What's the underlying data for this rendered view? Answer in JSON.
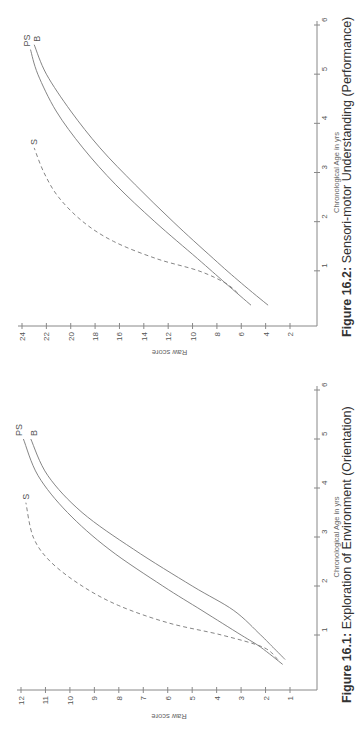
{
  "figures": [
    {
      "id": "fig-16-2",
      "caption_number": "Figure 16.2:",
      "caption_text": "Sensori-motor Understanding (Performance)",
      "xlabel": "Chronological Age in yrs",
      "ylabel": "Raw score"
    },
    {
      "id": "fig-16-1",
      "caption_number": "Figure 16.1:",
      "caption_text": "Exploration of Environment (Orientation)",
      "xlabel": "Chronological Age in yrs",
      "ylabel": "Raw score"
    }
  ],
  "chart_data": [
    {
      "type": "line",
      "title": "Figure 16.2: Sensori-motor Understanding (Performance)",
      "xlabel": "Chronological Age in yrs",
      "ylabel": "Raw score",
      "xlim": [
        0,
        6
      ],
      "ylim": [
        0,
        24
      ],
      "xticks": [
        1,
        2,
        3,
        4,
        5,
        6
      ],
      "yticks": [
        2,
        4,
        6,
        8,
        10,
        12,
        14,
        16,
        18,
        20,
        22,
        24
      ],
      "orientation": "rotated 90 degrees counter-clockwise on page",
      "grid": false,
      "series": [
        {
          "name": "PS",
          "style": "solid",
          "x": [
            0.3,
            0.75,
            1.25,
            2.0,
            2.75,
            3.5,
            4.25,
            5.0,
            5.5
          ],
          "y": [
            5.2,
            7.3,
            9.6,
            13.1,
            16.3,
            19.0,
            21.2,
            22.7,
            23.3
          ]
        },
        {
          "name": "B",
          "style": "solid",
          "x": [
            0.3,
            0.75,
            1.25,
            2.0,
            2.75,
            3.5,
            4.25,
            5.0,
            5.6
          ],
          "y": [
            3.8,
            6.0,
            8.3,
            11.6,
            14.7,
            17.6,
            20.0,
            22.0,
            23.0
          ]
        },
        {
          "name": "S",
          "style": "dashed",
          "x": [
            0.55,
            0.75,
            1.0,
            1.25,
            1.6,
            2.0,
            2.5,
            3.0,
            3.5
          ],
          "y": [
            6.3,
            7.3,
            9.5,
            13.0,
            16.5,
            19.0,
            21.0,
            22.2,
            23.0
          ]
        }
      ]
    },
    {
      "type": "line",
      "title": "Figure 16.1: Exploration of Environment (Orientation)",
      "xlabel": "Chronological Age in yrs",
      "ylabel": "Raw score",
      "xlim": [
        0,
        6
      ],
      "ylim": [
        0.7,
        12
      ],
      "xticks": [
        1,
        2,
        3,
        4,
        5,
        6
      ],
      "yticks": [
        1,
        2,
        3,
        4,
        5,
        6,
        7,
        8,
        9,
        10,
        11,
        12
      ],
      "orientation": "rotated 90 degrees counter-clockwise on page",
      "grid": false,
      "series": [
        {
          "name": "PS",
          "style": "solid",
          "x": [
            0.4,
            0.75,
            1.0,
            1.5,
            2.0,
            2.75,
            3.5,
            4.25,
            5.0
          ],
          "y": [
            1.3,
            2.2,
            3.0,
            4.6,
            6.2,
            8.4,
            10.1,
            11.3,
            11.9
          ]
        },
        {
          "name": "B",
          "style": "solid",
          "x": [
            0.5,
            0.75,
            1.0,
            1.5,
            2.0,
            2.75,
            3.5,
            4.25,
            5.0
          ],
          "y": [
            1.2,
            1.7,
            2.2,
            3.3,
            5.0,
            7.4,
            9.5,
            10.9,
            11.6
          ]
        },
        {
          "name": "S",
          "style": "dashed",
          "x": [
            0.5,
            0.75,
            1.0,
            1.25,
            1.6,
            2.0,
            2.5,
            3.0,
            3.7
          ],
          "y": [
            1.5,
            2.1,
            3.8,
            6.0,
            8.0,
            9.5,
            10.8,
            11.5,
            11.8
          ]
        }
      ]
    }
  ]
}
